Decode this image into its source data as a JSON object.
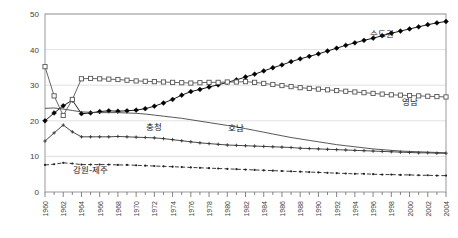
{
  "chart_data": {
    "type": "line",
    "title": "",
    "subtitle": "",
    "xlabel": "",
    "ylabel": "",
    "xlim": [
      1960,
      2004
    ],
    "ylim": [
      0,
      50
    ],
    "yticks": [
      0,
      10,
      20,
      30,
      40,
      50
    ],
    "ytick_labels": [
      "0",
      "10",
      "20",
      "30",
      "40",
      "50"
    ],
    "grid": "horizontal",
    "legend_position": "inline-annotations",
    "x": [
      1960,
      1961,
      1962,
      1963,
      1964,
      1965,
      1966,
      1967,
      1968,
      1969,
      1970,
      1971,
      1972,
      1973,
      1974,
      1975,
      1976,
      1977,
      1978,
      1979,
      1980,
      1981,
      1982,
      1983,
      1984,
      1985,
      1986,
      1987,
      1988,
      1989,
      1990,
      1991,
      1992,
      1993,
      1994,
      1995,
      1996,
      1997,
      1998,
      1999,
      2000,
      2001,
      2002,
      2003,
      2004
    ],
    "xtick_labels": [
      "1960",
      "1962",
      "1964",
      "1966",
      "1968",
      "1970",
      "1972",
      "1974",
      "1976",
      "1978",
      "1980",
      "1982",
      "1984",
      "1986",
      "1988",
      "1990",
      "1992",
      "1994",
      "1996",
      "1998",
      "2000",
      "2002",
      "2004"
    ],
    "series": [
      {
        "name": "수도권",
        "marker": "filled-diamond",
        "linestyle": "solid",
        "color": "#000000",
        "label_x": 1997,
        "label_y": 43.5,
        "values": [
          20.0,
          22.2,
          24.2,
          25.8,
          22.0,
          22.2,
          22.6,
          22.8,
          22.7,
          22.8,
          23.0,
          23.4,
          24.1,
          25.0,
          26.0,
          27.2,
          28.2,
          28.8,
          29.5,
          30.1,
          30.8,
          31.5,
          32.3,
          33.1,
          34.0,
          34.9,
          35.7,
          36.6,
          37.4,
          38.1,
          38.8,
          39.6,
          40.4,
          41.2,
          41.9,
          42.6,
          43.2,
          43.9,
          44.6,
          45.2,
          45.8,
          46.4,
          47.0,
          47.5,
          47.9
        ]
      },
      {
        "name": "영남",
        "marker": "open-square",
        "linestyle": "solid",
        "color": "#555555",
        "label_x": 2000,
        "label_y": 24.5,
        "values": [
          35.2,
          27.0,
          21.5,
          26.0,
          31.8,
          31.9,
          31.8,
          31.7,
          31.6,
          31.4,
          31.2,
          31.1,
          31.0,
          30.9,
          30.8,
          30.7,
          30.6,
          30.7,
          30.8,
          30.8,
          30.9,
          30.9,
          31.0,
          30.8,
          30.5,
          30.2,
          29.9,
          29.6,
          29.3,
          29.1,
          28.9,
          28.7,
          28.5,
          28.3,
          28.1,
          27.9,
          27.7,
          27.5,
          27.3,
          27.2,
          27.1,
          27.0,
          26.9,
          26.8,
          26.7
        ]
      },
      {
        "name": "호남",
        "marker": "none",
        "linestyle": "solid",
        "color": "#444444",
        "label_x": 1981,
        "label_y": 17.2,
        "values": [
          23.5,
          23.6,
          23.3,
          22.9,
          22.5,
          22.4,
          22.3,
          22.3,
          22.3,
          22.2,
          22.1,
          21.9,
          21.6,
          21.3,
          21.0,
          20.7,
          20.3,
          19.9,
          19.5,
          19.1,
          18.7,
          18.3,
          17.8,
          17.3,
          16.8,
          16.3,
          15.8,
          15.3,
          14.9,
          14.5,
          14.1,
          13.7,
          13.3,
          13.0,
          12.7,
          12.4,
          12.1,
          11.9,
          11.7,
          11.5,
          11.4,
          11.3,
          11.2,
          11.1,
          11.0
        ]
      },
      {
        "name": "충청",
        "marker": "small-cross",
        "linestyle": "solid",
        "color": "#333333",
        "label_x": 1972,
        "label_y": 17.4,
        "values": [
          14.3,
          16.6,
          18.8,
          16.9,
          15.5,
          15.5,
          15.5,
          15.5,
          15.6,
          15.5,
          15.4,
          15.3,
          15.2,
          15.0,
          14.7,
          14.4,
          14.1,
          13.8,
          13.6,
          13.4,
          13.2,
          13.1,
          13.0,
          12.9,
          12.8,
          12.7,
          12.6,
          12.5,
          12.3,
          12.2,
          12.1,
          12.0,
          11.9,
          11.8,
          11.7,
          11.6,
          11.5,
          11.4,
          11.3,
          11.2,
          11.1,
          11.0,
          11.0,
          10.9,
          10.9
        ]
      },
      {
        "name": "강원-제주",
        "marker": "dot",
        "linestyle": "dashed",
        "color": "#222222",
        "label_x": 1965,
        "label_y": 5.4,
        "values": [
          7.6,
          7.8,
          8.2,
          8.0,
          7.7,
          7.7,
          7.7,
          7.7,
          7.6,
          7.6,
          7.5,
          7.4,
          7.3,
          7.2,
          7.1,
          7.0,
          6.9,
          6.8,
          6.7,
          6.6,
          6.5,
          6.4,
          6.3,
          6.2,
          6.1,
          6.0,
          5.9,
          5.8,
          5.7,
          5.6,
          5.5,
          5.4,
          5.3,
          5.2,
          5.1,
          5.1,
          5.0,
          4.9,
          4.9,
          4.8,
          4.8,
          4.7,
          4.7,
          4.6,
          4.6
        ]
      }
    ]
  },
  "frame": {
    "border_color": "#999999",
    "grid_color": "#d9d9d9",
    "background": "#ffffff"
  }
}
